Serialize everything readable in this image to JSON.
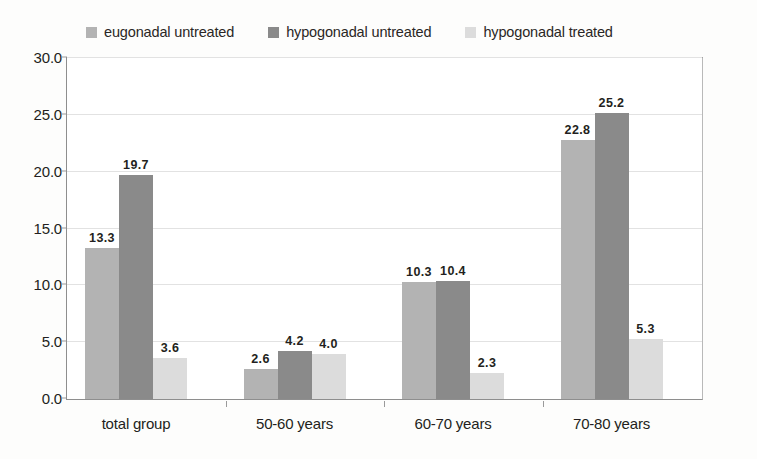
{
  "chart_data": {
    "type": "bar",
    "title": "",
    "subtitle": "",
    "xlabel": "",
    "ylabel": "",
    "categories": [
      "total group",
      "50-60 years",
      "60-70 years",
      "70-80 years"
    ],
    "series": [
      {
        "name": "eugonadal untreated",
        "color": "#b3b3b3",
        "values": [
          13.3,
          2.6,
          10.3,
          22.8
        ]
      },
      {
        "name": "hypogonadal untreated",
        "color": "#8a8a8a",
        "values": [
          19.7,
          4.2,
          10.4,
          25.2
        ]
      },
      {
        "name": "hypogonadal treated",
        "color": "#dcdcdc",
        "values": [
          3.6,
          4.0,
          2.3,
          5.3
        ]
      }
    ],
    "value_labels": [
      [
        "13.3",
        "19.7",
        "3.6"
      ],
      [
        "2.6",
        "4.2",
        "4.0"
      ],
      [
        "10.3",
        "10.4",
        "2.3"
      ],
      [
        "22.8",
        "25.2",
        "5.3"
      ]
    ],
    "ylim": [
      0.0,
      30.0
    ],
    "yticks": [
      0.0,
      5.0,
      10.0,
      15.0,
      20.0,
      25.0,
      30.0
    ],
    "ytick_labels": [
      "0.0",
      "5.0",
      "10.0",
      "15.0",
      "20.0",
      "25.0",
      "30.0"
    ],
    "grid": true,
    "grid_axis": "y",
    "legend_position": "top"
  },
  "legend": {
    "items": [
      {
        "label": "eugonadal untreated",
        "swatch": "#b3b3b3"
      },
      {
        "label": "hypogonadal untreated",
        "swatch": "#8a8a8a"
      },
      {
        "label": "hypogonadal treated",
        "swatch": "#dcdcdc"
      }
    ]
  },
  "axes": {
    "y_tick_labels": [
      "30.0",
      "25.0",
      "20.0",
      "15.0",
      "10.0",
      "5.0",
      "0.0"
    ],
    "x_tick_labels": [
      "total group",
      "50-60 years",
      "60-70 years",
      "70-80 years"
    ]
  }
}
